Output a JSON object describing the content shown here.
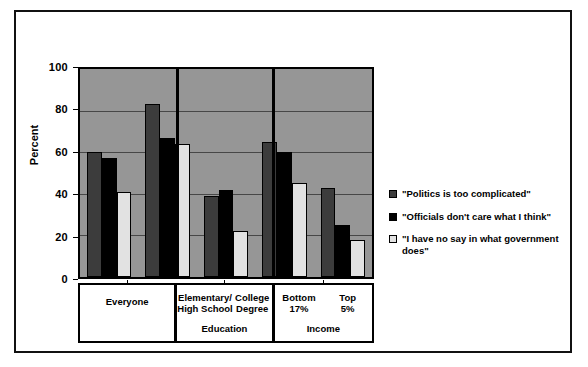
{
  "chart_data": {
    "type": "bar",
    "title": "",
    "xlabel": "",
    "ylabel": "Percent",
    "ylim": [
      0,
      100
    ],
    "yticks": [
      0,
      20,
      40,
      60,
      80,
      100
    ],
    "grid": true,
    "legend_position": "right",
    "categories": [
      "Everyone",
      "Elementary/ High School",
      "College Degree",
      "Bottom 17%",
      "Top 5%"
    ],
    "category_lines": [
      [
        "Everyone"
      ],
      [
        "Elementary/",
        "High School"
      ],
      [
        "College",
        "Degree"
      ],
      [
        "Bottom",
        "17%"
      ],
      [
        "Top",
        "5%"
      ]
    ],
    "group_titles": [
      "",
      "Education",
      "Income"
    ],
    "series": [
      {
        "name": "\"Politics is too complicated\"",
        "color": "#3c3c3c",
        "values": [
          60,
          83,
          39,
          65,
          43
        ]
      },
      {
        "name": "\"Officials don't care what I think\"",
        "color": "#000000",
        "values": [
          57,
          67,
          42,
          60,
          25
        ]
      },
      {
        "name": "\"I have no say in what government does\"",
        "color": "#e2e2e2",
        "values": [
          41,
          64,
          22,
          45,
          18
        ]
      }
    ]
  },
  "legend": {
    "items": [
      {
        "label": "\"Politics is too complicated\"",
        "swatch": "#3c3c3c"
      },
      {
        "label": "\"Officials don't care what I think\"",
        "swatch": "#000000"
      },
      {
        "label": "\"I have no say in what government does\"",
        "swatch": "#e2e2e2"
      }
    ]
  },
  "axis": {
    "y_title": "Percent",
    "y_ticks": [
      "0",
      "20",
      "40",
      "60",
      "80",
      "100"
    ]
  },
  "bands": {
    "education_title": "Education",
    "income_title": "Income"
  },
  "colors": {
    "plot_background": "#969696",
    "page_background": "#ffffff",
    "border": "#000000"
  }
}
